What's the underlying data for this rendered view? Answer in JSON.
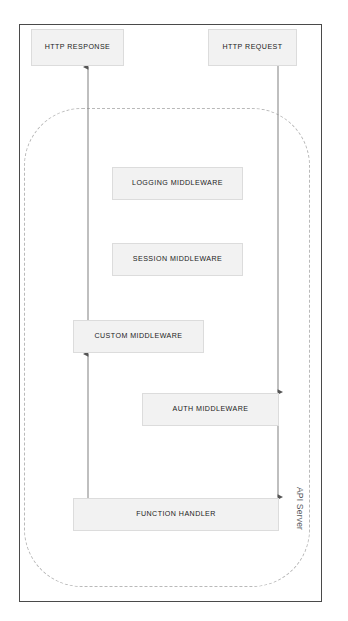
{
  "diagram": {
    "container_label": "API Server",
    "nodes": {
      "http_response": "HTTP RESPONSE",
      "http_request": "HTTP REQUEST",
      "logging_middleware": "LOGGING MIDDLEWARE",
      "session_middleware": "SESSION MIDDLEWARE",
      "custom_middleware": "CUSTOM MIDDLEWARE",
      "auth_middleware": "AUTH MIDDLEWARE",
      "function_handler": "FUNCTION HANDLER"
    },
    "colors": {
      "node_fill": "#f2f2f2",
      "node_border": "#dcdcdc",
      "frame_border": "#4a4a4a",
      "dashed_border": "#b9b9b9",
      "edge_stroke": "#8a8a8a",
      "text": "#1b1b1b"
    }
  }
}
